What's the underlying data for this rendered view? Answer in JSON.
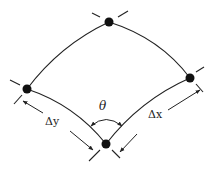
{
  "diagram": {
    "type": "shear-strain-element",
    "nodes": [
      {
        "id": "top",
        "x": 109,
        "y": 22
      },
      {
        "id": "left",
        "x": 27,
        "y": 89
      },
      {
        "id": "right",
        "x": 190,
        "y": 78
      },
      {
        "id": "bottom",
        "x": 106,
        "y": 144
      }
    ],
    "labels": {
      "theta": "θ",
      "delta_y": "Δy",
      "delta_x": "Δx"
    },
    "colors": {
      "line": "#222222",
      "node": "#111111",
      "background": "#ffffff"
    }
  }
}
